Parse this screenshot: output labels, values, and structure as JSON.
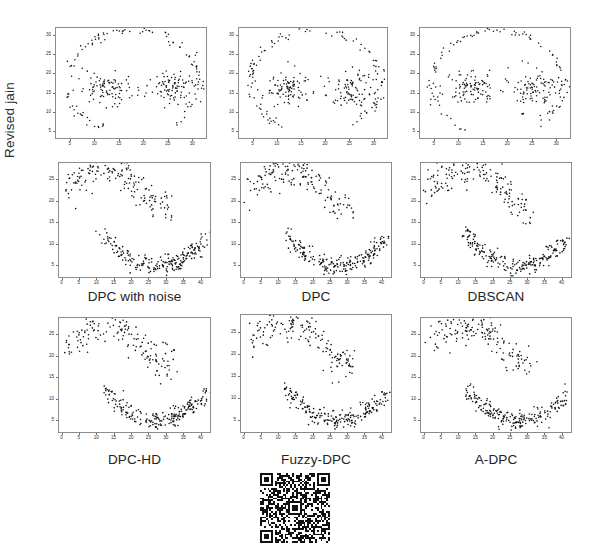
{
  "figure": {
    "ylabel": "Revised jain",
    "background": "#ffffff",
    "point_color": "#111111",
    "frame_color": "#8c8c8c",
    "rows": 3,
    "cols": 3
  },
  "captions": {
    "row2": [
      "DPC with noise",
      "DPC",
      "DBSCAN"
    ],
    "row3": [
      "DPC-HD",
      "Fuzzy-DPC",
      "A-DPC"
    ]
  },
  "qr": {
    "name": "qr-code",
    "alt": "QR code"
  },
  "chart_data": [
    {
      "id": "r1c1",
      "type": "scatter",
      "title": "",
      "xlabel": "",
      "ylabel": "",
      "xlim": [
        2,
        33
      ],
      "ylim": [
        3,
        32
      ],
      "xticks": [
        5,
        10,
        15,
        20,
        25,
        30
      ],
      "yticks": [
        5,
        10,
        15,
        20,
        25,
        30
      ],
      "grid": false,
      "legend": "none",
      "marker": "point",
      "dataset": "pathbased",
      "n_points": 300,
      "series": [
        {
          "name": "all points",
          "color": "#111111"
        }
      ]
    },
    {
      "id": "r1c2",
      "type": "scatter",
      "title": "",
      "xlabel": "",
      "ylabel": "",
      "xlim": [
        2,
        33
      ],
      "ylim": [
        3,
        32
      ],
      "xticks": [
        5,
        10,
        15,
        20,
        25,
        30
      ],
      "yticks": [
        5,
        10,
        15,
        20,
        25,
        30
      ],
      "grid": false,
      "legend": "none",
      "marker": "point",
      "dataset": "pathbased",
      "n_points": 300,
      "series": [
        {
          "name": "all points",
          "color": "#111111"
        }
      ]
    },
    {
      "id": "r1c3",
      "type": "scatter",
      "title": "",
      "xlabel": "",
      "ylabel": "",
      "xlim": [
        2,
        33
      ],
      "ylim": [
        3,
        32
      ],
      "xticks": [
        5,
        10,
        15,
        20,
        25,
        30
      ],
      "yticks": [
        5,
        10,
        15,
        20,
        25,
        30
      ],
      "grid": false,
      "legend": "none",
      "marker": "point",
      "dataset": "pathbased",
      "n_points": 300,
      "series": [
        {
          "name": "all points",
          "color": "#111111"
        }
      ]
    },
    {
      "id": "r2c1",
      "type": "scatter",
      "title": "DPC with noise",
      "xlabel": "",
      "ylabel": "Revised jain",
      "xlim": [
        -1,
        43
      ],
      "ylim": [
        2,
        29
      ],
      "xticks": [
        0,
        5,
        10,
        15,
        20,
        25,
        30,
        35,
        40
      ],
      "yticks": [
        5,
        10,
        15,
        20,
        25
      ],
      "grid": false,
      "legend": "none",
      "marker": "point",
      "dataset": "revised jain (two moons)",
      "n_points": 373,
      "series": [
        {
          "name": "all points",
          "color": "#111111"
        }
      ]
    },
    {
      "id": "r2c2",
      "type": "scatter",
      "title": "DPC",
      "xlabel": "",
      "ylabel": "",
      "xlim": [
        -1,
        43
      ],
      "ylim": [
        2,
        29
      ],
      "xticks": [
        0,
        5,
        10,
        15,
        20,
        25,
        30,
        35,
        40
      ],
      "yticks": [
        5,
        10,
        15,
        20,
        25
      ],
      "grid": false,
      "legend": "none",
      "marker": "point",
      "dataset": "revised jain (two moons)",
      "n_points": 373,
      "series": [
        {
          "name": "all points",
          "color": "#111111"
        }
      ]
    },
    {
      "id": "r2c3",
      "type": "scatter",
      "title": "DBSCAN",
      "xlabel": "",
      "ylabel": "",
      "xlim": [
        -1,
        43
      ],
      "ylim": [
        2,
        29
      ],
      "xticks": [
        0,
        5,
        10,
        15,
        20,
        25,
        30,
        35,
        40
      ],
      "yticks": [
        5,
        10,
        15,
        20,
        25
      ],
      "grid": false,
      "legend": "none",
      "marker": "point",
      "dataset": "revised jain (two moons)",
      "n_points": 373,
      "series": [
        {
          "name": "all points",
          "color": "#111111"
        }
      ]
    },
    {
      "id": "r3c1",
      "type": "scatter",
      "title": "DPC-HD",
      "xlabel": "",
      "ylabel": "",
      "xlim": [
        -1,
        43
      ],
      "ylim": [
        2,
        29
      ],
      "xticks": [
        0,
        5,
        10,
        15,
        20,
        25,
        30,
        35,
        40
      ],
      "yticks": [
        5,
        10,
        15,
        20,
        25
      ],
      "grid": false,
      "legend": "none",
      "marker": "point",
      "dataset": "revised jain (two moons)",
      "n_points": 373,
      "series": [
        {
          "name": "all points",
          "color": "#111111"
        }
      ]
    },
    {
      "id": "r3c2",
      "type": "scatter",
      "title": "Fuzzy-DPC",
      "xlabel": "",
      "ylabel": "",
      "xlim": [
        -1,
        43
      ],
      "ylim": [
        2,
        29
      ],
      "xticks": [
        0,
        5,
        10,
        15,
        20,
        25,
        30,
        35,
        40
      ],
      "yticks": [
        5,
        10,
        15,
        20,
        25
      ],
      "grid": false,
      "legend": "none",
      "marker": "point",
      "dataset": "revised jain (two moons)",
      "n_points": 373,
      "series": [
        {
          "name": "all points",
          "color": "#111111"
        }
      ]
    },
    {
      "id": "r3c3",
      "type": "scatter",
      "title": "A-DPC",
      "xlabel": "",
      "ylabel": "",
      "xlim": [
        -1,
        43
      ],
      "ylim": [
        2,
        29
      ],
      "xticks": [
        0,
        5,
        10,
        15,
        20,
        25,
        30,
        35,
        40
      ],
      "yticks": [
        5,
        10,
        15,
        20,
        25
      ],
      "grid": false,
      "legend": "none",
      "marker": "point",
      "dataset": "revised jain (two moons)",
      "n_points": 373,
      "series": [
        {
          "name": "all points",
          "color": "#111111"
        }
      ]
    }
  ]
}
